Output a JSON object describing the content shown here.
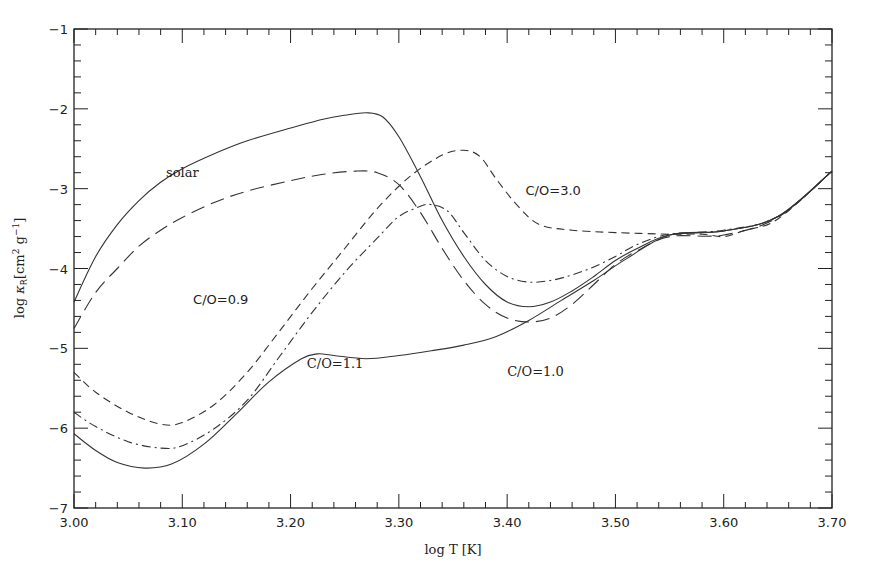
{
  "chart_data": {
    "type": "line",
    "title": "",
    "xlabel": "log T [K]",
    "ylabel": "log κR [cm² g⁻¹]",
    "ylabel_parts": {
      "prefix": "log ",
      "kappa": "κ",
      "sub": "R",
      "bracket": "[cm",
      "sup1": "2",
      "mid": " g",
      "sup2": "−1",
      "close": "]"
    },
    "xlim": [
      3.0,
      3.7
    ],
    "ylim": [
      -7,
      -1
    ],
    "grid": false,
    "legend": "inline annotations",
    "x_ticks": [
      {
        "value": 3.0,
        "label": "3.00"
      },
      {
        "value": 3.1,
        "label": "3.10"
      },
      {
        "value": 3.2,
        "label": "3.20"
      },
      {
        "value": 3.3,
        "label": "3.30"
      },
      {
        "value": 3.4,
        "label": "3.40"
      },
      {
        "value": 3.5,
        "label": "3.50"
      },
      {
        "value": 3.6,
        "label": "3.60"
      },
      {
        "value": 3.7,
        "label": "3.70"
      }
    ],
    "y_ticks": [
      {
        "value": -1,
        "label": "−1"
      },
      {
        "value": -2,
        "label": "−2"
      },
      {
        "value": -3,
        "label": "−3"
      },
      {
        "value": -4,
        "label": "−4"
      },
      {
        "value": -5,
        "label": "−5"
      },
      {
        "value": -6,
        "label": "−6"
      },
      {
        "value": -7,
        "label": "−7"
      }
    ],
    "series": [
      {
        "name": "solar",
        "style": "solid",
        "dash": "",
        "x": [
          3.0,
          3.02,
          3.04,
          3.06,
          3.08,
          3.1,
          3.13,
          3.16,
          3.2,
          3.23,
          3.25,
          3.27,
          3.285,
          3.3,
          3.32,
          3.34,
          3.36,
          3.38,
          3.4,
          3.42,
          3.44,
          3.46,
          3.48,
          3.5,
          3.52,
          3.55,
          3.6,
          3.65,
          3.7
        ],
        "y": [
          -4.42,
          -3.85,
          -3.45,
          -3.15,
          -2.92,
          -2.75,
          -2.56,
          -2.4,
          -2.24,
          -2.13,
          -2.08,
          -2.05,
          -2.1,
          -2.35,
          -2.85,
          -3.4,
          -3.85,
          -4.2,
          -4.42,
          -4.48,
          -4.42,
          -4.28,
          -4.1,
          -3.9,
          -3.75,
          -3.58,
          -3.53,
          -3.35,
          -2.78
        ]
      },
      {
        "name": "C/O=0.9",
        "style": "long-dash",
        "dash": "14,7",
        "x": [
          3.0,
          3.02,
          3.04,
          3.06,
          3.08,
          3.1,
          3.13,
          3.16,
          3.2,
          3.23,
          3.26,
          3.28,
          3.3,
          3.32,
          3.34,
          3.36,
          3.38,
          3.4,
          3.42,
          3.44,
          3.46,
          3.48,
          3.5,
          3.52,
          3.55,
          3.6,
          3.65,
          3.7
        ],
        "y": [
          -4.75,
          -4.3,
          -4.0,
          -3.72,
          -3.52,
          -3.36,
          -3.17,
          -3.03,
          -2.9,
          -2.82,
          -2.78,
          -2.8,
          -2.95,
          -3.3,
          -3.75,
          -4.15,
          -4.45,
          -4.62,
          -4.67,
          -4.62,
          -4.45,
          -4.2,
          -3.95,
          -3.78,
          -3.6,
          -3.58,
          -3.36,
          -2.78
        ]
      },
      {
        "name": "C/O=1.0",
        "style": "solid",
        "dash": "",
        "x": [
          3.0,
          3.02,
          3.04,
          3.065,
          3.09,
          3.12,
          3.15,
          3.18,
          3.21,
          3.225,
          3.24,
          3.27,
          3.3,
          3.33,
          3.36,
          3.39,
          3.42,
          3.45,
          3.48,
          3.51,
          3.55,
          3.6,
          3.65,
          3.7
        ],
        "y": [
          -6.07,
          -6.28,
          -6.43,
          -6.5,
          -6.45,
          -6.2,
          -5.82,
          -5.42,
          -5.13,
          -5.07,
          -5.09,
          -5.13,
          -5.09,
          -5.03,
          -4.96,
          -4.85,
          -4.65,
          -4.4,
          -4.15,
          -3.88,
          -3.58,
          -3.53,
          -3.35,
          -2.78
        ]
      },
      {
        "name": "C/O=1.1",
        "style": "dash-dot",
        "dash": "9,4,2,4",
        "x": [
          3.0,
          3.02,
          3.05,
          3.08,
          3.1,
          3.13,
          3.16,
          3.19,
          3.22,
          3.25,
          3.28,
          3.3,
          3.32,
          3.33,
          3.345,
          3.36,
          3.38,
          3.4,
          3.42,
          3.44,
          3.46,
          3.48,
          3.5,
          3.52,
          3.55,
          3.6,
          3.65,
          3.7
        ],
        "y": [
          -5.8,
          -5.98,
          -6.17,
          -6.25,
          -6.22,
          -6.0,
          -5.65,
          -5.1,
          -4.55,
          -4.05,
          -3.62,
          -3.35,
          -3.22,
          -3.2,
          -3.28,
          -3.55,
          -3.9,
          -4.1,
          -4.17,
          -4.15,
          -4.08,
          -3.98,
          -3.85,
          -3.7,
          -3.57,
          -3.52,
          -3.35,
          -2.78
        ]
      },
      {
        "name": "C/O=3.0",
        "style": "short-dash",
        "dash": "8,5",
        "x": [
          3.0,
          3.02,
          3.05,
          3.08,
          3.1,
          3.13,
          3.16,
          3.19,
          3.22,
          3.25,
          3.28,
          3.31,
          3.34,
          3.36,
          3.375,
          3.39,
          3.41,
          3.43,
          3.46,
          3.5,
          3.55,
          3.58,
          3.6,
          3.62,
          3.65,
          3.7
        ],
        "y": [
          -5.3,
          -5.55,
          -5.8,
          -5.95,
          -5.93,
          -5.7,
          -5.3,
          -4.78,
          -4.25,
          -3.75,
          -3.25,
          -2.85,
          -2.58,
          -2.52,
          -2.6,
          -2.88,
          -3.22,
          -3.45,
          -3.52,
          -3.55,
          -3.57,
          -3.57,
          -3.6,
          -3.52,
          -3.38,
          -2.78
        ]
      }
    ],
    "annotations": [
      {
        "text": "solar",
        "x": 3.085,
        "y": -2.85,
        "font": "serif"
      },
      {
        "text": "C/O=0.9",
        "x": 3.11,
        "y": -4.45,
        "font": "sans"
      },
      {
        "text": "C/O=1.1",
        "x": 3.215,
        "y": -5.25,
        "font": "serif"
      },
      {
        "text": "C/O=1.0",
        "x": 3.4,
        "y": -5.35,
        "font": "serif"
      },
      {
        "text": "C/O=3.0",
        "x": 3.417,
        "y": -3.08,
        "font": "sans"
      }
    ]
  }
}
